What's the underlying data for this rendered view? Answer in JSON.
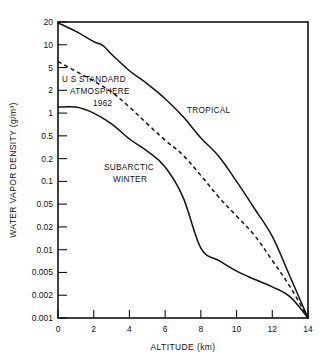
{
  "chart_data": {
    "type": "line",
    "title": "",
    "xlabel": "ALTITUDE (km)",
    "ylabel": "WATER VAPOR DENSITY (g/m³)",
    "xlim": [
      0,
      14
    ],
    "ylim": [
      0.001,
      20
    ],
    "yscale": "log",
    "xscale": "linear",
    "grid": false,
    "legend_position": "inline-annotations",
    "xticks": [
      0,
      2,
      4,
      6,
      8,
      10,
      12,
      14
    ],
    "xtick_labels": [
      "0",
      "2",
      "4",
      "6",
      "8",
      "10",
      "12",
      "14"
    ],
    "yticks": [
      20,
      10,
      5,
      2,
      1,
      0.5,
      0.2,
      0.1,
      0.05,
      0.02,
      0.01,
      0.005,
      0.002,
      0.001
    ],
    "ytick_labels": [
      "20",
      "10",
      "5",
      "2",
      "1",
      "0.5",
      "0.2",
      "0.1",
      "0.05",
      "0.02",
      "0.01",
      "0.005",
      "0.002",
      "0.001"
    ],
    "series": [
      {
        "name": "TROPICAL",
        "style": "solid",
        "x": [
          0,
          1,
          2,
          2.5,
          3,
          4,
          5,
          6,
          7,
          8,
          9,
          10,
          11,
          12,
          13,
          14
        ],
        "y": [
          19.5,
          15.0,
          11.0,
          9.8,
          7.5,
          4.4,
          2.6,
          1.55,
          0.9,
          0.46,
          0.22,
          0.1,
          0.042,
          0.015,
          0.0042,
          0.001
        ]
      },
      {
        "name": "U S STANDARD ATMOSPHERE 1962",
        "style": "dashed",
        "x": [
          0,
          1,
          2,
          3,
          4,
          5,
          6,
          7,
          8,
          9,
          10,
          11,
          12,
          13,
          14
        ],
        "y": [
          6.0,
          4.3,
          2.9,
          1.9,
          1.2,
          0.72,
          0.42,
          0.23,
          0.12,
          0.062,
          0.031,
          0.0155,
          0.0072,
          0.0028,
          0.001
        ]
      },
      {
        "name": "SUBARCTIC WINTER",
        "style": "solid",
        "x": [
          0,
          1,
          2,
          3,
          4,
          5,
          6,
          7,
          8,
          9,
          10,
          11,
          12,
          13,
          14
        ],
        "y": [
          1.2,
          1.2,
          1.0,
          0.72,
          0.44,
          0.27,
          0.155,
          0.062,
          0.0105,
          0.0072,
          0.0052,
          0.0038,
          0.0028,
          0.0019,
          0.001
        ]
      }
    ],
    "annotations": [
      {
        "text": "U S STANDARD",
        "x_px": 62,
        "y_px": 82
      },
      {
        "text": "ATMOSPHERE",
        "x_px": 70,
        "y_px": 94
      },
      {
        "text": "1962",
        "x_px": 93,
        "y_px": 106
      },
      {
        "text": "TROPICAL",
        "x_px": 187,
        "y_px": 113
      },
      {
        "text": "SUBARCTIC",
        "x_px": 104,
        "y_px": 170
      },
      {
        "text": "WINTER",
        "x_px": 113,
        "y_px": 182
      }
    ]
  }
}
